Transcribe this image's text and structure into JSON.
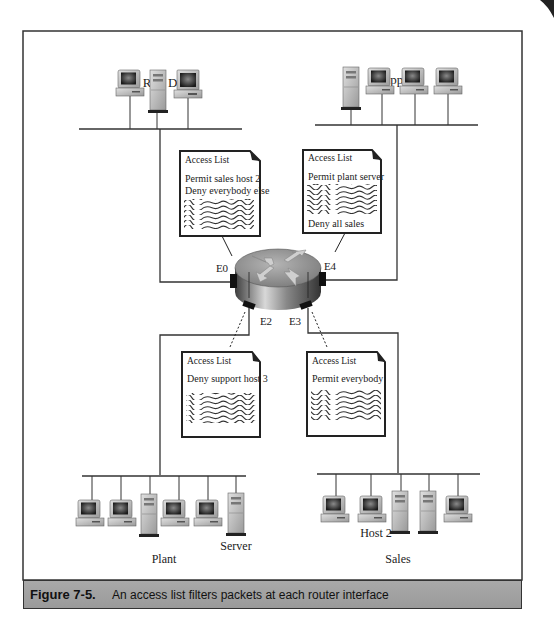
{
  "segments": {
    "rnd": {
      "label": "R & D"
    },
    "support": {
      "label": "Support"
    },
    "plant": {
      "label": "Plant",
      "server_label": "Server"
    },
    "sales": {
      "label": "Sales",
      "host_label": "Host 2"
    }
  },
  "router": {
    "interfaces": {
      "e0": "E0",
      "e2": "E2",
      "e3": "E3",
      "e4": "E4"
    }
  },
  "access_lists": {
    "e0": {
      "title": "Access List",
      "lines": [
        "Permit sales host 2",
        "Deny everybody else"
      ],
      "footer": ""
    },
    "e4": {
      "title": "Access List",
      "lines": [
        "Permit plant server"
      ],
      "footer": "Deny all sales"
    },
    "e2": {
      "title": "Access List",
      "lines": [
        "Deny support host 3"
      ],
      "footer": ""
    },
    "e3": {
      "title": "Access List",
      "lines": [
        "Permit everybody"
      ],
      "footer": ""
    }
  },
  "caption": {
    "number": "Figure 7-5.",
    "text": "An access list filters packets at each router interface"
  },
  "colors": {
    "frame": "#333333",
    "caption_bg": "#a3a3a3",
    "router_top": "#9a9a9a",
    "router_side": "#6e6e6e"
  }
}
